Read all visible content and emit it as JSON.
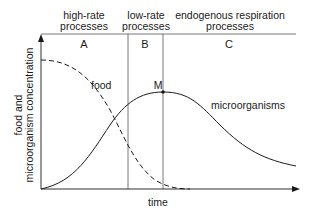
{
  "phases": [
    {
      "id": "A",
      "title_line1": "high-rate",
      "title_line2": "processes",
      "letter": "A"
    },
    {
      "id": "B",
      "title_line1": "low-rate",
      "title_line2": "processes",
      "letter": "B"
    },
    {
      "id": "C",
      "title_line1": "endogenous respiration",
      "title_line2": "processes",
      "letter": "C"
    }
  ],
  "axes": {
    "x_label": "time",
    "y_label_line1": "food and",
    "y_label_line2": "microorganism concentration"
  },
  "curves": {
    "food_label": "food",
    "microorganisms_label": "microorganisms",
    "peak_label": "M"
  },
  "colors": {
    "line": "#1a1a1a",
    "divider": "#555555"
  }
}
